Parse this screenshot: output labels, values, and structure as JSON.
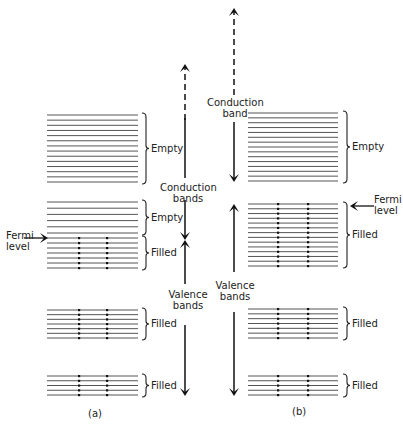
{
  "figure": {
    "panel_a": {
      "caption": "(a)",
      "axis": {
        "conduction_label_line1": "Conduction",
        "conduction_label_line2": "bands",
        "valence_label_line1": "Valence",
        "valence_label_line2": "bands"
      },
      "fermi_label_line1": "Fermi",
      "fermi_label_line2": "level",
      "bands": [
        {
          "name": "upper-conduction-band",
          "lines": 14,
          "y_top": 115,
          "y_bottom": 182,
          "filled": false,
          "label": "Empty"
        },
        {
          "name": "partial-band-empty-part",
          "lines": 6,
          "y_top": 202,
          "y_bottom": 233,
          "filled": false,
          "label": "Empty"
        },
        {
          "name": "partial-band-filled-part",
          "lines": 7,
          "y_top": 238,
          "y_bottom": 268,
          "filled": true,
          "label": "Filled"
        },
        {
          "name": "valence-band-2",
          "lines": 7,
          "y_top": 310,
          "y_bottom": 338,
          "filled": true,
          "label": "Filled"
        },
        {
          "name": "valence-band-3",
          "lines": 5,
          "y_top": 376,
          "y_bottom": 395,
          "filled": true,
          "label": "Filled"
        }
      ]
    },
    "panel_b": {
      "caption": "(b)",
      "axis": {
        "conduction_label_line1": "Conduction",
        "conduction_label_line2": "band",
        "valence_label_line1": "Valence",
        "valence_label_line2": "bands"
      },
      "fermi_label_line1": "Fermi",
      "fermi_label_line2": "level",
      "bands": [
        {
          "name": "conduction-band",
          "lines": 15,
          "y_top": 113,
          "y_bottom": 181,
          "filled": false,
          "label": "Empty"
        },
        {
          "name": "valence-band-1",
          "lines": 14,
          "y_top": 204,
          "y_bottom": 266,
          "filled": true,
          "label": "Filled"
        },
        {
          "name": "valence-band-2",
          "lines": 7,
          "y_top": 309,
          "y_bottom": 338,
          "filled": true,
          "label": "Filled"
        },
        {
          "name": "valence-band-3",
          "lines": 5,
          "y_top": 376,
          "y_bottom": 395,
          "filled": true,
          "label": "Filled"
        }
      ]
    },
    "colors": {
      "line": "#555555",
      "text": "#222222",
      "dot": "#111111",
      "background": "#ffffff"
    }
  }
}
